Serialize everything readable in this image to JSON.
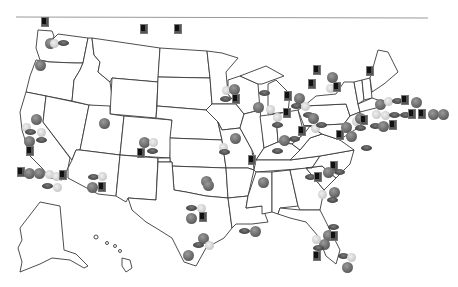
{
  "map": {
    "title": "US sports teams map",
    "colors": {
      "state_stroke": "#3a3a3a",
      "basketball": "#5e5e5e",
      "baseball": "#d0d0d0",
      "football": "#4a4a4a",
      "hockey": "#111111"
    },
    "legend_types": [
      "basketball",
      "baseball",
      "football",
      "hockey"
    ],
    "icons": [
      {
        "type": "hockey",
        "x": 41,
        "y": 17
      },
      {
        "type": "hockey",
        "x": 140,
        "y": 24
      },
      {
        "type": "hockey",
        "x": 174,
        "y": 24
      },
      {
        "type": "basketball",
        "x": 45,
        "y": 38
      },
      {
        "type": "baseball",
        "x": 50,
        "y": 39
      },
      {
        "type": "football",
        "x": 58,
        "y": 40
      },
      {
        "type": "basketball",
        "x": 35,
        "y": 60
      },
      {
        "type": "basketball",
        "x": 31,
        "y": 114
      },
      {
        "type": "baseball",
        "x": 22,
        "y": 123
      },
      {
        "type": "baseball",
        "x": 37,
        "y": 128
      },
      {
        "type": "football",
        "x": 25,
        "y": 129
      },
      {
        "type": "basketball",
        "x": 24,
        "y": 136
      },
      {
        "type": "football",
        "x": 36,
        "y": 137
      },
      {
        "type": "hockey",
        "x": 26,
        "y": 146
      },
      {
        "type": "basketball",
        "x": 99,
        "y": 118
      },
      {
        "type": "hockey",
        "x": 17,
        "y": 167
      },
      {
        "type": "basketball",
        "x": 24,
        "y": 168
      },
      {
        "type": "basketball",
        "x": 34,
        "y": 168
      },
      {
        "type": "baseball",
        "x": 45,
        "y": 170
      },
      {
        "type": "baseball",
        "x": 52,
        "y": 172
      },
      {
        "type": "hockey",
        "x": 59,
        "y": 170
      },
      {
        "type": "football",
        "x": 42,
        "y": 183
      },
      {
        "type": "baseball",
        "x": 53,
        "y": 183
      },
      {
        "type": "basketball",
        "x": 139,
        "y": 137
      },
      {
        "type": "baseball",
        "x": 149,
        "y": 138
      },
      {
        "type": "hockey",
        "x": 137,
        "y": 148
      },
      {
        "type": "football",
        "x": 147,
        "y": 148
      },
      {
        "type": "football",
        "x": 88,
        "y": 174
      },
      {
        "type": "baseball",
        "x": 98,
        "y": 172
      },
      {
        "type": "basketball",
        "x": 87,
        "y": 182
      },
      {
        "type": "hockey",
        "x": 98,
        "y": 182
      },
      {
        "type": "basketball",
        "x": 201,
        "y": 176
      },
      {
        "type": "football",
        "x": 186,
        "y": 205
      },
      {
        "type": "baseball",
        "x": 197,
        "y": 204
      },
      {
        "type": "basketball",
        "x": 186,
        "y": 213
      },
      {
        "type": "hockey",
        "x": 199,
        "y": 212
      },
      {
        "type": "basketball",
        "x": 198,
        "y": 233
      },
      {
        "type": "football",
        "x": 193,
        "y": 242
      },
      {
        "type": "baseball",
        "x": 205,
        "y": 241
      },
      {
        "type": "basketball",
        "x": 183,
        "y": 250
      },
      {
        "type": "football",
        "x": 239,
        "y": 228
      },
      {
        "type": "basketball",
        "x": 250,
        "y": 226
      },
      {
        "type": "basketball",
        "x": 203,
        "y": 180
      },
      {
        "type": "baseball",
        "x": 222,
        "y": 86
      },
      {
        "type": "football",
        "x": 220,
        "y": 96
      },
      {
        "type": "basketball",
        "x": 229,
        "y": 84
      },
      {
        "type": "hockey",
        "x": 232,
        "y": 94
      },
      {
        "type": "football",
        "x": 259,
        "y": 90
      },
      {
        "type": "basketball",
        "x": 253,
        "y": 102
      },
      {
        "type": "baseball",
        "x": 266,
        "y": 105
      },
      {
        "type": "baseball",
        "x": 273,
        "y": 113
      },
      {
        "type": "football",
        "x": 272,
        "y": 122
      },
      {
        "type": "hockey",
        "x": 284,
        "y": 91
      },
      {
        "type": "basketball",
        "x": 294,
        "y": 93
      },
      {
        "type": "football",
        "x": 291,
        "y": 103
      },
      {
        "type": "hockey",
        "x": 283,
        "y": 108
      },
      {
        "type": "baseball",
        "x": 301,
        "y": 102
      },
      {
        "type": "football",
        "x": 303,
        "y": 112
      },
      {
        "type": "hockey",
        "x": 298,
        "y": 126
      },
      {
        "type": "basketball",
        "x": 308,
        "y": 113
      },
      {
        "type": "baseball",
        "x": 311,
        "y": 124
      },
      {
        "type": "football",
        "x": 316,
        "y": 122
      },
      {
        "type": "hockey",
        "x": 313,
        "y": 65
      },
      {
        "type": "hockey",
        "x": 308,
        "y": 79
      },
      {
        "type": "basketball",
        "x": 327,
        "y": 72
      },
      {
        "type": "baseball",
        "x": 326,
        "y": 84
      },
      {
        "type": "hockey",
        "x": 333,
        "y": 82
      },
      {
        "type": "hockey",
        "x": 366,
        "y": 66
      },
      {
        "type": "basketball",
        "x": 230,
        "y": 133
      },
      {
        "type": "baseball",
        "x": 219,
        "y": 143
      },
      {
        "type": "football",
        "x": 219,
        "y": 149
      },
      {
        "type": "hockey",
        "x": 248,
        "y": 155
      },
      {
        "type": "basketball",
        "x": 258,
        "y": 177
      },
      {
        "type": "football",
        "x": 272,
        "y": 148
      },
      {
        "type": "basketball",
        "x": 279,
        "y": 135
      },
      {
        "type": "football",
        "x": 289,
        "y": 136
      },
      {
        "type": "football",
        "x": 305,
        "y": 174
      },
      {
        "type": "hockey",
        "x": 314,
        "y": 172
      },
      {
        "type": "hockey",
        "x": 330,
        "y": 161
      },
      {
        "type": "basketball",
        "x": 323,
        "y": 167
      },
      {
        "type": "football",
        "x": 334,
        "y": 169
      },
      {
        "type": "basketball",
        "x": 329,
        "y": 187
      },
      {
        "type": "baseball",
        "x": 318,
        "y": 190
      },
      {
        "type": "football",
        "x": 327,
        "y": 197
      },
      {
        "type": "basketball",
        "x": 341,
        "y": 122
      },
      {
        "type": "hockey",
        "x": 336,
        "y": 130
      },
      {
        "type": "basketball",
        "x": 346,
        "y": 131
      },
      {
        "type": "baseball",
        "x": 352,
        "y": 117
      },
      {
        "type": "football",
        "x": 355,
        "y": 125
      },
      {
        "type": "basketball",
        "x": 355,
        "y": 113
      },
      {
        "type": "hockey",
        "x": 360,
        "y": 115
      },
      {
        "type": "basketball",
        "x": 375,
        "y": 99
      },
      {
        "type": "baseball",
        "x": 384,
        "y": 97
      },
      {
        "type": "football",
        "x": 392,
        "y": 98
      },
      {
        "type": "hockey",
        "x": 401,
        "y": 95
      },
      {
        "type": "basketball",
        "x": 411,
        "y": 97
      },
      {
        "type": "baseball",
        "x": 372,
        "y": 110
      },
      {
        "type": "baseball",
        "x": 381,
        "y": 111
      },
      {
        "type": "football",
        "x": 389,
        "y": 112
      },
      {
        "type": "football",
        "x": 400,
        "y": 112
      },
      {
        "type": "hockey",
        "x": 408,
        "y": 109
      },
      {
        "type": "hockey",
        "x": 418,
        "y": 109
      },
      {
        "type": "basketball",
        "x": 428,
        "y": 109
      },
      {
        "type": "basketball",
        "x": 438,
        "y": 109
      },
      {
        "type": "football",
        "x": 370,
        "y": 123
      },
      {
        "type": "basketball",
        "x": 378,
        "y": 121
      },
      {
        "type": "hockey",
        "x": 389,
        "y": 120
      },
      {
        "type": "football",
        "x": 361,
        "y": 145
      },
      {
        "type": "basketball",
        "x": 323,
        "y": 230
      },
      {
        "type": "hockey",
        "x": 330,
        "y": 231
      },
      {
        "type": "basketball",
        "x": 319,
        "y": 239
      },
      {
        "type": "football",
        "x": 328,
        "y": 224
      },
      {
        "type": "baseball",
        "x": 312,
        "y": 235
      },
      {
        "type": "football",
        "x": 313,
        "y": 245
      },
      {
        "type": "hockey",
        "x": 313,
        "y": 251
      },
      {
        "type": "football",
        "x": 338,
        "y": 253
      },
      {
        "type": "baseball",
        "x": 347,
        "y": 253
      },
      {
        "type": "basketball",
        "x": 342,
        "y": 262
      }
    ]
  }
}
